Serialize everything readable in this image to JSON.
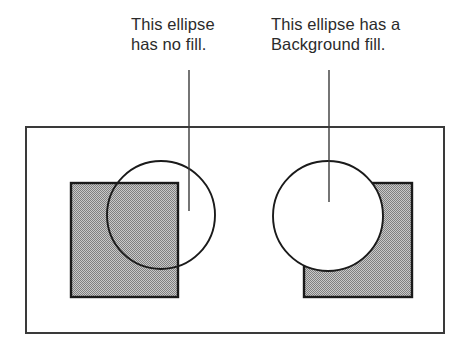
{
  "figure": {
    "background_color": "#ffffff",
    "width": 470,
    "height": 345
  },
  "colors": {
    "ink": "#2b2b2b",
    "outline": "#1a1a1a",
    "gray_fill": "#a9a9a9",
    "gray_fill_dither_dark": "#6e6e6e",
    "white_fill": "#ffffff",
    "frame_stroke": "#3a3a3a"
  },
  "callouts": [
    {
      "id": "no-fill",
      "line1": "This ellipse",
      "line2": "has no fill.",
      "leader_x": 189,
      "leader_top": 70,
      "leader_bottom": 211
    },
    {
      "id": "background-fill",
      "line1": "This ellipse has a",
      "line2": "Background fill.",
      "leader_x": 329,
      "leader_top": 70,
      "leader_bottom": 202
    }
  ],
  "frame": {
    "x": 26,
    "y": 127,
    "width": 418,
    "height": 206,
    "stroke_width": 2
  },
  "examples": [
    {
      "id": "example-no-fill",
      "rectangle": {
        "x": 71,
        "y": 183,
        "width": 107,
        "height": 114,
        "fill": "gray"
      },
      "ellipse": {
        "cx": 161,
        "cy": 215,
        "rx": 54,
        "ry": 54,
        "fill": "none"
      }
    },
    {
      "id": "example-background-fill",
      "rectangle": {
        "x": 304,
        "y": 183,
        "width": 108,
        "height": 114,
        "fill": "gray"
      },
      "ellipse": {
        "cx": 328,
        "cy": 216,
        "rx": 55,
        "ry": 55,
        "fill": "white"
      }
    }
  ]
}
